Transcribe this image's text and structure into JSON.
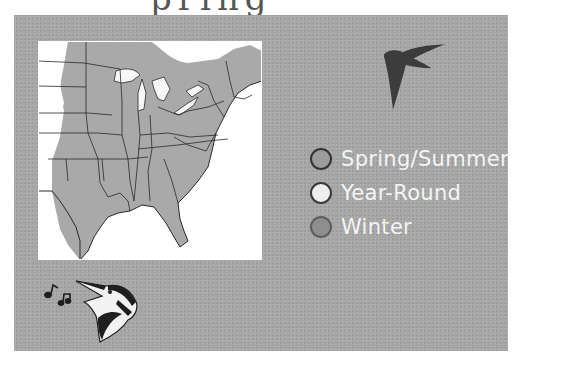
{
  "header": {
    "title_fragment": "pring"
  },
  "map": {
    "region": "Eastern United States",
    "range_fill_color": "#a9a9a9",
    "background_color": "#ffffff",
    "border_color": "#2a2a2a"
  },
  "icons": {
    "bird_silhouette": "chimney-swift-silhouette",
    "song_icon": "singing-bird-head-with-music-notes"
  },
  "legend": {
    "items": [
      {
        "label": "Spring/Summer",
        "fill": "#9c9c9c",
        "stroke": "#333333"
      },
      {
        "label": "Year-Round",
        "fill": "#eeeeee",
        "stroke": "#3a3a3a"
      },
      {
        "label": "Winter",
        "fill": "#8e8e8e",
        "stroke": "#5e5e5e"
      }
    ]
  },
  "colors": {
    "panel_background": "#a7a7a7",
    "legend_text": "#f4f4f4",
    "silhouette": "#3c3c3c"
  }
}
